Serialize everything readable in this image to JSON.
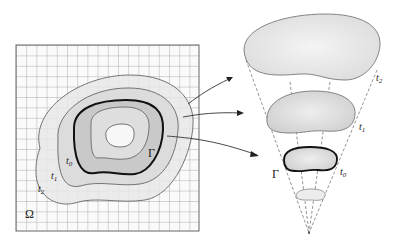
{
  "figure": {
    "left_panel": {
      "domain_label": "Ω",
      "front_label": "Γ",
      "level_labels": [
        "t0",
        "t1",
        "t2"
      ],
      "level_label_display": {
        "t0": {
          "base": "t",
          "sub": "0"
        },
        "t1": {
          "base": "t",
          "sub": "1"
        },
        "t2": {
          "base": "t",
          "sub": "2"
        }
      }
    },
    "right_panel": {
      "front_label": "Γ",
      "slice_labels": [
        {
          "base": "t",
          "sub": "2"
        },
        {
          "base": "t",
          "sub": "1"
        },
        {
          "base": "t",
          "sub": "0"
        }
      ]
    },
    "colors": {
      "grid": "#8a8a8a",
      "outer_fill": "#e6e6e6",
      "mid_fill": "#d6d6d6",
      "inner_fill": "#c4c4c4",
      "core_fill": "#dcdcdc",
      "hole_fill": "#f2f2f2",
      "stroke": "#555555",
      "front_stroke": "#111111"
    }
  }
}
